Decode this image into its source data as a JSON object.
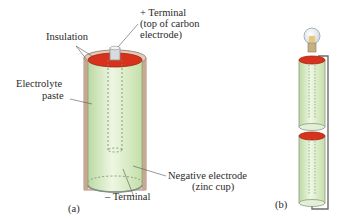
{
  "figure_a": {
    "labels": {
      "insulation": "Insulation",
      "plus_terminal_line1": "+ Terminal",
      "plus_terminal_line2": "(top of carbon",
      "plus_terminal_line3": "electrode)",
      "electrolyte_line1": "Electrolyte",
      "electrolyte_line2": "paste",
      "negative_electrode_line1": "Negative electrode",
      "negative_electrode_line2": "(zinc cup)",
      "minus_terminal": "– Terminal"
    },
    "caption": "(a)"
  },
  "figure_b": {
    "caption": "(b)"
  },
  "colors": {
    "electrolyte_green": "#d9ecc4",
    "top_red": "#d8321c",
    "insulation_tan": "#c9a892",
    "wire_gray": "#6b6b6b"
  }
}
